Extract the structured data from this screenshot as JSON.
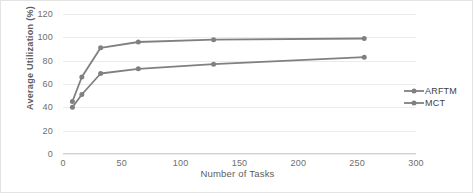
{
  "chart_data": {
    "type": "line",
    "title": "",
    "xlabel": "Number of Tasks",
    "ylabel": "Average Utilization  (%)",
    "xlim": [
      0,
      300
    ],
    "ylim": [
      0,
      120
    ],
    "grid": true,
    "legend_position": "right",
    "xticks": [
      "0",
      "50",
      "100",
      "150",
      "200",
      "250",
      "300"
    ],
    "xtick_values": [
      0,
      50,
      100,
      150,
      200,
      250,
      300
    ],
    "yticks": [
      "0",
      "20",
      "40",
      "60",
      "80",
      "100",
      "120"
    ],
    "ytick_values": [
      0,
      20,
      40,
      60,
      80,
      100,
      120
    ],
    "x": [
      8,
      16,
      32,
      64,
      128,
      256
    ],
    "series": [
      {
        "name": "ARFTM",
        "color": "#808080",
        "marker": "circle",
        "values": [
          45,
          66,
          91,
          96,
          98,
          99
        ]
      },
      {
        "name": "MCT",
        "color": "#808080",
        "marker": "circle",
        "values": [
          40,
          51,
          69,
          73,
          77,
          83
        ]
      }
    ]
  },
  "legend": {
    "items": [
      {
        "label": "ARFTM"
      },
      {
        "label": "MCT"
      }
    ]
  },
  "style": {
    "line_color": "#808080",
    "grid_color": "#ebebeb",
    "text_color": "#6e6e6e",
    "border_color": "#e3e3e3",
    "background": "#ffffff"
  }
}
